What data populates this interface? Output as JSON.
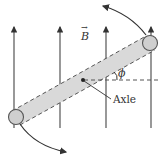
{
  "diagram": {
    "field_label": "B",
    "field_vector_arrow": "→",
    "angle_label": "ϕ",
    "axle_label": "Axle",
    "field_lines_x": [
      14,
      60,
      106,
      151
    ],
    "colors": {
      "line": "#333333",
      "rod_fill": "#d9d9d9",
      "sphere_fill": "#cfcfcf",
      "dashed": "#555555"
    }
  }
}
